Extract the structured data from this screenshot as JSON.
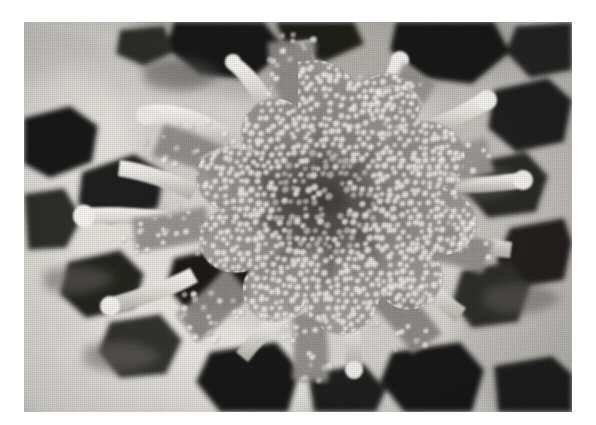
{
  "page": {
    "background_color": "#ffffff",
    "width": 596,
    "height": 425
  },
  "figure": {
    "name": "sem-micrograph",
    "caption": "",
    "alt_text": "Scanning electron micrograph of a radially symmetric papillate structure with finger-like projections",
    "frame": {
      "left": 24,
      "top": 22,
      "width": 548,
      "height": 390
    },
    "border": "none",
    "rendering": "grayscale halftone print",
    "palette": {
      "paper_white": "#ffffff",
      "highlight": "#f2f0ec",
      "light_matrix": "#d8d5cf",
      "mid_tone": "#9b9893",
      "body_tone": "#7d7a75",
      "shadow": "#4a4845",
      "deep_void": "#1c1b1a",
      "black": "#0d0d0c"
    },
    "subject": {
      "type": "radial star-shaped biological structure",
      "surface": "densely papillate / granular",
      "granule_appearance": "bright rings with darker centers",
      "granule_spacing_px": 8,
      "arm_count": 9,
      "center": {
        "x": 276,
        "y": 188
      }
    },
    "regions": [
      {
        "label": "central-core",
        "tone": "mid_tone"
      },
      {
        "label": "radiating-arms",
        "tone": "body_tone"
      },
      {
        "label": "tube-projections",
        "tone": "highlight"
      },
      {
        "label": "surrounding-voids",
        "tone": "deep_void"
      },
      {
        "label": "membranous-matrix",
        "tone": "light_matrix"
      }
    ]
  }
}
